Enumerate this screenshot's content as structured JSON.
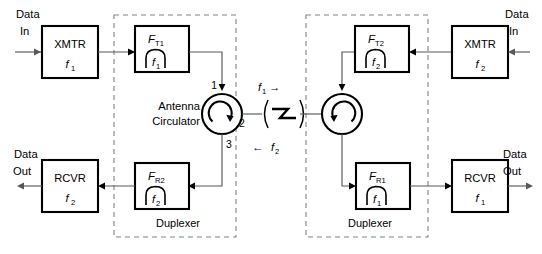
{
  "diagram": {
    "colors": {
      "wire": "#55585c",
      "outline": "#000000",
      "dashed_group": "#808386",
      "background": "#ffffff"
    },
    "left_terminal": {
      "data_in": {
        "line1": "Data",
        "line2": "In"
      },
      "data_out": {
        "line1": "Data",
        "line2": "Out"
      },
      "transmitter": {
        "name": "XMTR",
        "freq": "f",
        "freq_sub": "1"
      },
      "receiver": {
        "name": "RCVR",
        "freq": "f",
        "freq_sub": "2"
      },
      "tx_filter": {
        "name": "F",
        "name_sub": "T1",
        "freq": "f",
        "freq_sub": "1"
      },
      "rx_filter": {
        "name": "F",
        "name_sub": "R2",
        "freq": "f",
        "freq_sub": "2"
      },
      "circulator": {
        "label_line1": "Antenna",
        "label_line2": "Circulator",
        "ports": {
          "p1": "1",
          "p2": "2",
          "p3": "3"
        },
        "rotation": "clockwise"
      },
      "duplexer_label": "Duplexer"
    },
    "right_terminal": {
      "data_in": {
        "line1": "Data",
        "line2": "In"
      },
      "data_out": {
        "line1": "Data",
        "line2": "Out"
      },
      "transmitter": {
        "name": "XMTR",
        "freq": "f",
        "freq_sub": "2"
      },
      "receiver": {
        "name": "RCVR",
        "freq": "f",
        "freq_sub": "1"
      },
      "tx_filter": {
        "name": "F",
        "name_sub": "T2",
        "freq": "f",
        "freq_sub": "2"
      },
      "rx_filter": {
        "name": "F",
        "name_sub": "R1",
        "freq": "f",
        "freq_sub": "1"
      },
      "circulator": {
        "rotation": "counter-clockwise"
      },
      "duplexer_label": "Duplexer"
    },
    "link": {
      "symbol": "wireless-propagation",
      "forward": {
        "freq": "f",
        "freq_sub": "1",
        "arrow": "→"
      },
      "reverse": {
        "freq": "f",
        "freq_sub": "2",
        "arrow": "←"
      }
    }
  }
}
